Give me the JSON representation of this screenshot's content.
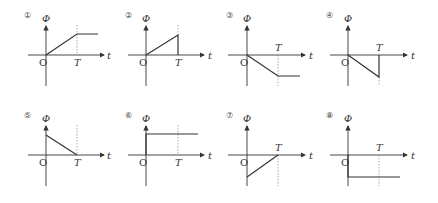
{
  "axis_labels": {
    "y": "Φ",
    "x": "t",
    "origin": "O",
    "tick": "T"
  },
  "options": [
    {
      "id": "①",
      "shape": "linear rise from 0 to T, then constant"
    },
    {
      "id": "②",
      "shape": "linear rise from 0 to T, then drops to 0"
    },
    {
      "id": "③",
      "shape": "linear fall from 0 to T, then constant negative"
    },
    {
      "id": "④",
      "shape": "linear fall from 0 to T, then returns to 0"
    },
    {
      "id": "⑤",
      "shape": "starts positive at 0, linear fall to 0 at T"
    },
    {
      "id": "⑥",
      "shape": "step up at 0, constant positive"
    },
    {
      "id": "⑦",
      "shape": "starts negative at 0, linear rise to 0 at T"
    },
    {
      "id": "⑧",
      "shape": "step down at 0, constant negative"
    }
  ],
  "colors": {
    "line": "#333333",
    "dashed": "#888888"
  }
}
